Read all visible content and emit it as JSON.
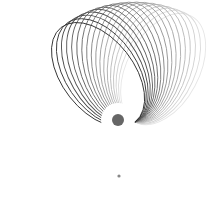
{
  "diagram": {
    "central_body": {
      "cx": 118,
      "cy": 120,
      "r": 6,
      "halo_r": 17,
      "color": "#666666"
    },
    "pivot": {
      "x": 135,
      "y": 122
    },
    "orbit_count": 18,
    "start_angle_deg": 232,
    "end_angle_deg": 298,
    "semi_major": 60,
    "semi_minor": 36,
    "dark_color": "#333333",
    "light_color": "#e6e6e6",
    "marker": {
      "x": 119,
      "y": 176,
      "r": 1.6,
      "color": "#888888"
    }
  }
}
